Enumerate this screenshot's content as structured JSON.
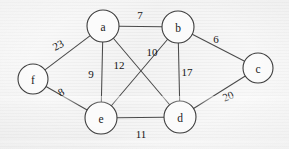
{
  "diagram": {
    "type": "graph",
    "canvas": {
      "width": 289,
      "height": 149
    },
    "style": {
      "background_color": "#f2f2f2",
      "node_fill": "#fbfbfb",
      "node_stroke": "#3d3d3d",
      "edge_stroke": "#4a4a4a",
      "label_color": "#1a1a1a"
    },
    "nodes": [
      {
        "id": "a",
        "label": "a",
        "cx": 103,
        "cy": 26,
        "r": 16
      },
      {
        "id": "b",
        "label": "b",
        "cx": 178,
        "cy": 27,
        "r": 16
      },
      {
        "id": "c",
        "label": "c",
        "cx": 258,
        "cy": 68,
        "r": 15
      },
      {
        "id": "d",
        "label": "d",
        "cx": 180,
        "cy": 117,
        "r": 16
      },
      {
        "id": "e",
        "label": "e",
        "cx": 101,
        "cy": 118,
        "r": 16
      },
      {
        "id": "f",
        "label": "f",
        "cx": 33,
        "cy": 79,
        "r": 15
      }
    ],
    "edges": [
      {
        "id": "a-b",
        "source": "a",
        "target": "b",
        "weight": "7",
        "label_x": 140,
        "label_y": 15
      },
      {
        "id": "a-f",
        "source": "a",
        "target": "f",
        "weight": "23",
        "label_x": 58,
        "label_y": 45,
        "rotate": -27
      },
      {
        "id": "a-e",
        "source": "a",
        "target": "e",
        "weight": "9",
        "label_x": 91,
        "label_y": 74
      },
      {
        "id": "a-d",
        "source": "a",
        "target": "d",
        "weight": "12",
        "label_x": 119,
        "label_y": 65
      },
      {
        "id": "b-c",
        "source": "b",
        "target": "c",
        "weight": "6",
        "label_x": 216,
        "label_y": 39
      },
      {
        "id": "b-d",
        "source": "b",
        "target": "d",
        "weight": "17",
        "label_x": 187,
        "label_y": 72
      },
      {
        "id": "b-e",
        "source": "b",
        "target": "e",
        "weight": "10",
        "label_x": 152,
        "label_y": 52
      },
      {
        "id": "c-d",
        "source": "c",
        "target": "d",
        "weight": "20",
        "label_x": 228,
        "label_y": 96,
        "rotate": -22
      },
      {
        "id": "d-e",
        "source": "d",
        "target": "e",
        "weight": "11",
        "label_x": 141,
        "label_y": 134
      },
      {
        "id": "e-f",
        "source": "e",
        "target": "f",
        "weight": "8",
        "label_x": 61,
        "label_y": 92,
        "rotate": -27
      }
    ]
  }
}
